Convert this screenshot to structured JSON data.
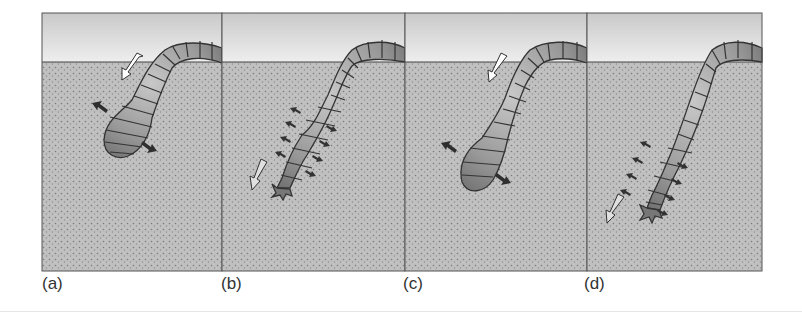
{
  "figure": {
    "colors": {
      "sky_top": "#cfcfcf",
      "sky_bottom": "#ececec",
      "soil": "#bdbdbd",
      "soil_dots": "#8a8a8a",
      "frame": "#555555",
      "worm_fill": "#9a9a9a",
      "worm_stroke": "#3a3a3a",
      "arrow_dark": "#333333",
      "arrow_light": "#ffffff"
    },
    "panels": [
      {
        "id": "a",
        "label": "(a)",
        "phase": "anterior segments contracted longitudinally and swollen; pushing outward against soil",
        "motion_arrow": "white arrow pointing down-left"
      },
      {
        "id": "b",
        "label": "(b)",
        "phase": "anterior segments elongated and thin; tip probing forward",
        "motion_arrow": "light arrow pointing down-left"
      },
      {
        "id": "c",
        "label": "(c)",
        "phase": "anterior segments swollen again, anchoring; body drawn forward",
        "motion_arrow": "white arrow pointing down-left"
      },
      {
        "id": "d",
        "label": "(d)",
        "phase": "anterior segments elongated; tip advanced deeper",
        "motion_arrow": "light arrow pointing down-left"
      }
    ]
  }
}
